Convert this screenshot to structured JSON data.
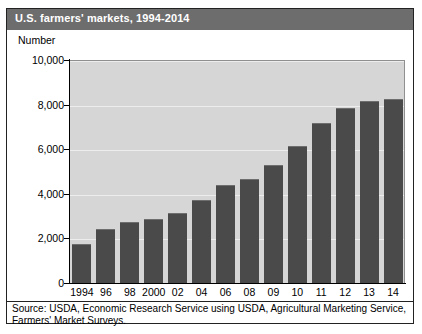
{
  "figure": {
    "title": "U.S. farmers' markets, 1994-2014",
    "axis_unit_label": "Number",
    "source_line_1": "Source: USDA, Economic Research Service using USDA, Agricultural Marketing Service,",
    "source_line_2": "Farmers' Market Surveys."
  },
  "colors": {
    "title_bar": "#6d6d6d",
    "title_text": "#ffffff",
    "plot_background": "#d6d6d6",
    "bar_fill": "#4a4a4a",
    "gridline": "#ededed",
    "axis": "#000000",
    "frame": "#222222"
  },
  "chart_data": {
    "type": "bar",
    "title": "U.S. farmers' markets, 1994-2014",
    "xlabel": "",
    "ylabel": "Number",
    "categories": [
      "1994",
      "96",
      "98",
      "2000",
      "02",
      "04",
      "06",
      "08",
      "09",
      "10",
      "11",
      "12",
      "13",
      "14"
    ],
    "values": [
      1755,
      2410,
      2746,
      2863,
      3137,
      3706,
      4385,
      4685,
      5274,
      6132,
      7175,
      7864,
      8144,
      8268
    ],
    "ylim": [
      0,
      10000
    ],
    "yticks": [
      0,
      2000,
      4000,
      6000,
      8000,
      10000
    ],
    "ytick_labels": [
      "0",
      "2,000",
      "4,000",
      "6,000",
      "8,000",
      "10,000"
    ],
    "grid": true,
    "grid_axis": "y",
    "legend": false,
    "legend_position": "none"
  }
}
